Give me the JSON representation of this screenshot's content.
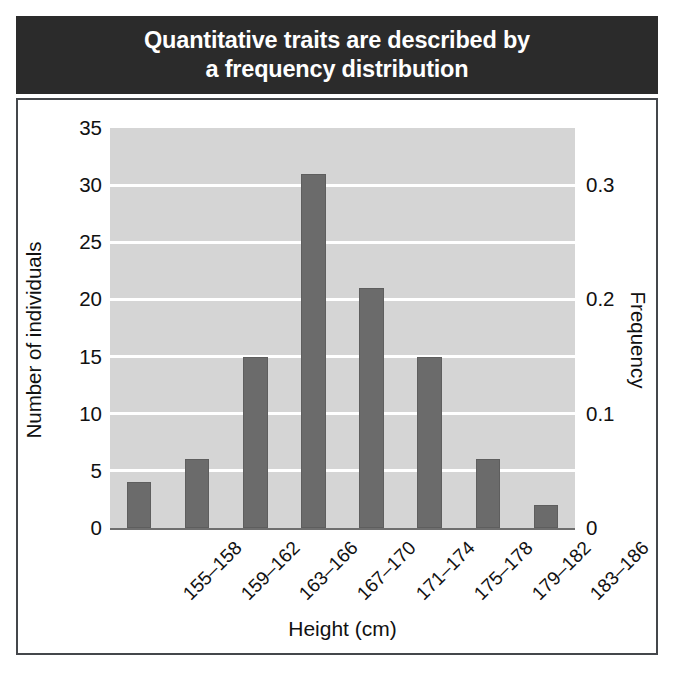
{
  "title": {
    "text": "Quantitative traits are described by\na frequency distribution"
  },
  "colors": {
    "title_bar_bg": "#2b2b2b",
    "title_text": "#ffffff",
    "plot_bg": "#d5d5d5",
    "bar": "#6b6b6b",
    "gridline": "#ffffff",
    "frame_border": "#44474b",
    "axis_text": "#111111"
  },
  "chart_data": {
    "type": "bar",
    "title": "Quantitative traits are described by a frequency distribution",
    "xlabel": "Height (cm)",
    "ylabel": "Number of individuals",
    "y2label": "Frequency",
    "categories": [
      "155–158",
      "159–162",
      "163–166",
      "167–170",
      "171–174",
      "175–178",
      "179–182",
      "183–186"
    ],
    "values": [
      4,
      6,
      15,
      31,
      21,
      15,
      6,
      2
    ],
    "ylim": [
      0,
      35
    ],
    "yticks": [
      0,
      5,
      10,
      15,
      20,
      25,
      30,
      35
    ],
    "ytick_labels": [
      "0",
      "5",
      "10",
      "15",
      "20",
      "25",
      "30",
      "35"
    ],
    "y2lim": [
      0,
      0.35
    ],
    "y2ticks": [
      0,
      0.1,
      0.2,
      0.3
    ],
    "y2tick_labels": [
      "0",
      "0.1",
      "0.2",
      "0.3"
    ],
    "grid": true,
    "legend": false,
    "bar_color": "#6b6b6b",
    "total_individuals": 100
  }
}
